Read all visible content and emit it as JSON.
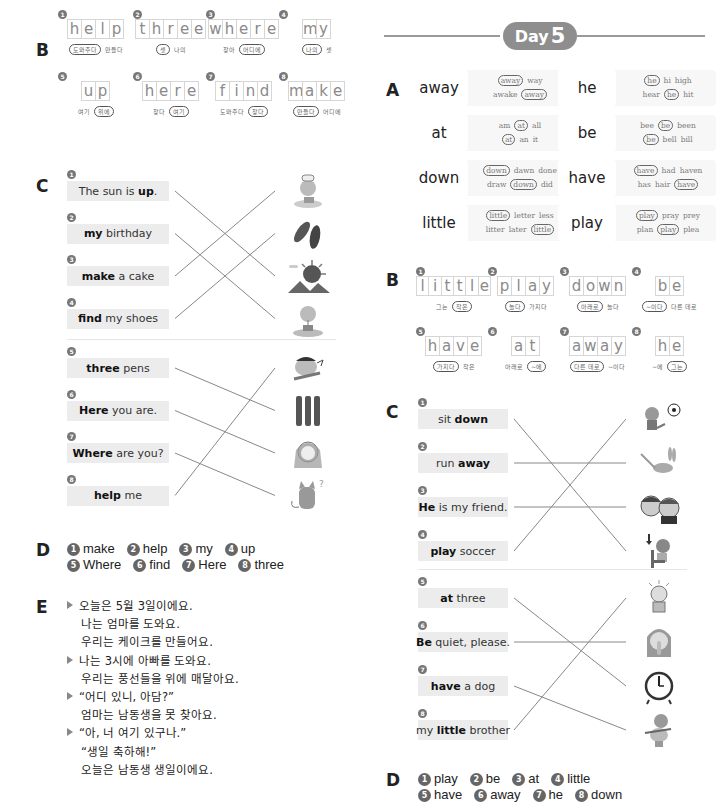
{
  "left": {
    "sectionB": {
      "letter": "B",
      "items": [
        {
          "num": "1",
          "word": "help",
          "options": [
            {
              "text": "도와주다",
              "circled": true
            },
            {
              "text": "만들다",
              "circled": false
            }
          ]
        },
        {
          "num": "2",
          "word": "three",
          "options": [
            {
              "text": "셋",
              "circled": true
            },
            {
              "text": "나의",
              "circled": false
            }
          ]
        },
        {
          "num": "3",
          "word": "where",
          "options": [
            {
              "text": "찾아",
              "circled": false
            },
            {
              "text": "어디에",
              "circled": true
            }
          ]
        },
        {
          "num": "4",
          "word": "my",
          "options": [
            {
              "text": "나의",
              "circled": true
            },
            {
              "text": "셋",
              "circled": false
            }
          ]
        },
        {
          "num": "5",
          "word": "up",
          "options": [
            {
              "text": "여기",
              "circled": false
            },
            {
              "text": "위에",
              "circled": true
            }
          ]
        },
        {
          "num": "6",
          "word": "here",
          "options": [
            {
              "text": "찾다",
              "circled": false
            },
            {
              "text": "여기",
              "circled": true
            }
          ]
        },
        {
          "num": "7",
          "word": "find",
          "options": [
            {
              "text": "도와주다",
              "circled": false
            },
            {
              "text": "찾다",
              "circled": true
            }
          ]
        },
        {
          "num": "8",
          "word": "make",
          "options": [
            {
              "text": "만들다",
              "circled": true
            },
            {
              "text": "어디에",
              "circled": false
            }
          ]
        }
      ]
    },
    "sectionC": {
      "letter": "C",
      "groups": [
        {
          "items": [
            {
              "num": "1",
              "bold": "up",
              "pre": "The sun is ",
              "post": "."
            },
            {
              "num": "2",
              "bold": "my",
              "pre": "",
              "post": " birthday"
            },
            {
              "num": "3",
              "bold": "make",
              "pre": "",
              "post": " a cake"
            },
            {
              "num": "4",
              "bold": "find",
              "pre": "",
              "post": " my shoes"
            }
          ],
          "pictures": [
            "chef-child-cake",
            "shoes",
            "sun-mountains",
            "girl-birthday-cake"
          ],
          "matches": [
            3,
            4,
            1,
            2
          ]
        },
        {
          "items": [
            {
              "num": "5",
              "bold": "three",
              "pre": "",
              "post": " pens"
            },
            {
              "num": "6",
              "bold": "Here",
              "pre": "",
              "post": " you are."
            },
            {
              "num": "7",
              "bold": "Where",
              "pre": "",
              "post": " are you?"
            },
            {
              "num": "8",
              "bold": "help",
              "pre": "",
              "post": " me"
            }
          ],
          "pictures": [
            "crying-boy",
            "three-pens",
            "girl-headband",
            "cat-question"
          ],
          "matches": [
            2,
            3,
            4,
            1
          ]
        }
      ]
    },
    "sectionD": {
      "letter": "D",
      "answers": [
        {
          "num": "1",
          "text": "make"
        },
        {
          "num": "2",
          "text": "help"
        },
        {
          "num": "3",
          "text": "my"
        },
        {
          "num": "4",
          "text": "up"
        },
        {
          "num": "5",
          "text": "Where"
        },
        {
          "num": "6",
          "text": "find"
        },
        {
          "num": "7",
          "text": "Here"
        },
        {
          "num": "8",
          "text": "three"
        }
      ]
    },
    "sectionE": {
      "letter": "E",
      "lines": [
        {
          "bullet": true,
          "text": "오늘은 5월 3일이에요."
        },
        {
          "bullet": false,
          "text": "나는 엄마를 도와요."
        },
        {
          "bullet": false,
          "text": "우리는 케이크를 만들어요."
        },
        {
          "bullet": true,
          "text": "나는 3시에 아빠를 도와요."
        },
        {
          "bullet": false,
          "text": "우리는 풍선들을 위에 매달아요."
        },
        {
          "bullet": true,
          "text": "“어디 있니, 아담?”"
        },
        {
          "bullet": false,
          "text": "엄마는 남동생을 못 찾아요."
        },
        {
          "bullet": true,
          "text": "“아, 너 여기 있구나.”"
        },
        {
          "bullet": false,
          "text": "“생일 축하해!”"
        },
        {
          "bullet": false,
          "text": "오늘은 남동생 생일이에요."
        }
      ]
    }
  },
  "right": {
    "header": {
      "day_label": "Day",
      "day_number": "5"
    },
    "sectionA": {
      "letter": "A",
      "cards": [
        {
          "word": "away",
          "row1": [
            {
              "t": "away",
              "c": true
            },
            {
              "t": "way",
              "c": false
            }
          ],
          "row2": [
            {
              "t": "awake",
              "c": false
            },
            {
              "t": "away",
              "c": true
            }
          ]
        },
        {
          "word": "he",
          "row1": [
            {
              "t": "he",
              "c": true
            },
            {
              "t": "hi",
              "c": false
            },
            {
              "t": "high",
              "c": false
            }
          ],
          "row2": [
            {
              "t": "hear",
              "c": false
            },
            {
              "t": "he",
              "c": true
            },
            {
              "t": "hit",
              "c": false
            }
          ]
        },
        {
          "word": "at",
          "row1": [
            {
              "t": "am",
              "c": false
            },
            {
              "t": "at",
              "c": true
            },
            {
              "t": "all",
              "c": false
            }
          ],
          "row2": [
            {
              "t": "at",
              "c": true
            },
            {
              "t": "an",
              "c": false
            },
            {
              "t": "it",
              "c": false
            }
          ]
        },
        {
          "word": "be",
          "row1": [
            {
              "t": "bee",
              "c": false
            },
            {
              "t": "be",
              "c": true
            },
            {
              "t": "been",
              "c": false
            }
          ],
          "row2": [
            {
              "t": "be",
              "c": true
            },
            {
              "t": "bell",
              "c": false
            },
            {
              "t": "bill",
              "c": false
            }
          ]
        },
        {
          "word": "down",
          "row1": [
            {
              "t": "down",
              "c": true
            },
            {
              "t": "dawn",
              "c": false
            },
            {
              "t": "done",
              "c": false
            }
          ],
          "row2": [
            {
              "t": "draw",
              "c": false
            },
            {
              "t": "down",
              "c": true
            },
            {
              "t": "did",
              "c": false
            }
          ]
        },
        {
          "word": "have",
          "row1": [
            {
              "t": "have",
              "c": true
            },
            {
              "t": "had",
              "c": false
            },
            {
              "t": "haven",
              "c": false
            }
          ],
          "row2": [
            {
              "t": "has",
              "c": false
            },
            {
              "t": "hair",
              "c": false
            },
            {
              "t": "have",
              "c": true
            }
          ]
        },
        {
          "word": "little",
          "row1": [
            {
              "t": "little",
              "c": true
            },
            {
              "t": "letter",
              "c": false
            },
            {
              "t": "less",
              "c": false
            }
          ],
          "row2": [
            {
              "t": "litter",
              "c": false
            },
            {
              "t": "later",
              "c": false
            },
            {
              "t": "little",
              "c": true
            }
          ]
        },
        {
          "word": "play",
          "row1": [
            {
              "t": "play",
              "c": true
            },
            {
              "t": "pray",
              "c": false
            },
            {
              "t": "prey",
              "c": false
            }
          ],
          "row2": [
            {
              "t": "plan",
              "c": false
            },
            {
              "t": "play",
              "c": true
            },
            {
              "t": "plea",
              "c": false
            }
          ]
        }
      ]
    },
    "sectionB": {
      "letter": "B",
      "items": [
        {
          "num": "1",
          "word": "little",
          "options": [
            {
              "text": "그는",
              "circled": false
            },
            {
              "text": "작은",
              "circled": true
            }
          ]
        },
        {
          "num": "2",
          "word": "play",
          "options": [
            {
              "text": "놀다",
              "circled": true
            },
            {
              "text": "가지다",
              "circled": false
            }
          ]
        },
        {
          "num": "3",
          "word": "down",
          "options": [
            {
              "text": "아래로",
              "circled": true
            },
            {
              "text": "놀다",
              "circled": false
            }
          ]
        },
        {
          "num": "4",
          "word": "be",
          "options": [
            {
              "text": "~이다",
              "circled": true
            },
            {
              "text": "다른 데로",
              "circled": false
            }
          ]
        },
        {
          "num": "5",
          "word": "have",
          "options": [
            {
              "text": "가지다",
              "circled": true
            },
            {
              "text": "작은",
              "circled": false
            }
          ]
        },
        {
          "num": "6",
          "word": "at",
          "options": [
            {
              "text": "아래로",
              "circled": false
            },
            {
              "text": "~에",
              "circled": true
            }
          ]
        },
        {
          "num": "7",
          "word": "away",
          "options": [
            {
              "text": "다른 데로",
              "circled": true
            },
            {
              "text": "~이다",
              "circled": false
            }
          ]
        },
        {
          "num": "8",
          "word": "he",
          "options": [
            {
              "text": "~에",
              "circled": false
            },
            {
              "text": "그는",
              "circled": true
            }
          ]
        }
      ]
    },
    "sectionC": {
      "letter": "C",
      "groups": [
        {
          "items": [
            {
              "num": "1",
              "bold": "down",
              "pre": "sit ",
              "post": ""
            },
            {
              "num": "2",
              "bold": "away",
              "pre": "run ",
              "post": ""
            },
            {
              "num": "3",
              "bold": "He",
              "pre": "",
              "post": " is my friend."
            },
            {
              "num": "4",
              "bold": "play",
              "pre": "",
              "post": " soccer"
            }
          ],
          "pictures": [
            "girl-kicking-soccer-ball",
            "rabbit-running",
            "two-friends",
            "girl-sitting-chair"
          ],
          "matches": [
            4,
            2,
            3,
            1
          ]
        },
        {
          "items": [
            {
              "num": "5",
              "bold": "at",
              "pre": "",
              "post": " three"
            },
            {
              "num": "6",
              "bold": "Be",
              "pre": "",
              "post": " quiet, please."
            },
            {
              "num": "7",
              "bold": "have",
              "pre": "",
              "post": " a dog"
            },
            {
              "num": "8",
              "bold": "little",
              "pre": "my ",
              "post": " brother"
            }
          ],
          "pictures": [
            "little-boy",
            "woman-shushing",
            "alarm-clock",
            "boy-hugging-dog"
          ],
          "matches": [
            3,
            2,
            4,
            1
          ]
        }
      ]
    },
    "sectionD": {
      "letter": "D",
      "answers": [
        {
          "num": "1",
          "text": "play"
        },
        {
          "num": "2",
          "text": "be"
        },
        {
          "num": "3",
          "text": "at"
        },
        {
          "num": "4",
          "text": "little"
        },
        {
          "num": "5",
          "text": "have"
        },
        {
          "num": "6",
          "text": "away"
        },
        {
          "num": "7",
          "text": "he"
        },
        {
          "num": "8",
          "text": "down"
        }
      ]
    }
  }
}
